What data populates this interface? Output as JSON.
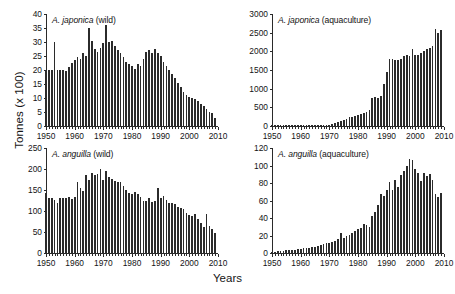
{
  "figure": {
    "ylabel": "Tonnes (x 100)",
    "xlabel": "Years",
    "bar_color": "#2b2b2b",
    "axis_color": "#2a2a2a"
  },
  "chart_data": [
    {
      "type": "bar",
      "panel": "top-left",
      "title": "A. japonica (wild)",
      "species": "A. japonica",
      "source": "wild",
      "xlabel": "Years",
      "ylabel": "Tonnes (x 100)",
      "ylim": [
        0,
        40
      ],
      "yticks": [
        0,
        5,
        10,
        15,
        20,
        25,
        30,
        35,
        40
      ],
      "xlim": [
        1950,
        2010
      ],
      "xticks": [
        1950,
        1960,
        1970,
        1980,
        1990,
        2000,
        2010
      ],
      "grid": false,
      "legend": "none",
      "x": [
        1950,
        1951,
        1952,
        1953,
        1954,
        1955,
        1956,
        1957,
        1958,
        1959,
        1960,
        1961,
        1962,
        1963,
        1964,
        1965,
        1966,
        1967,
        1968,
        1969,
        1970,
        1971,
        1972,
        1973,
        1974,
        1975,
        1976,
        1977,
        1978,
        1979,
        1980,
        1981,
        1982,
        1983,
        1984,
        1985,
        1986,
        1987,
        1988,
        1989,
        1990,
        1991,
        1992,
        1993,
        1994,
        1995,
        1996,
        1997,
        1998,
        1999,
        2000,
        2001,
        2002,
        2003,
        2004,
        2005,
        2006,
        2007,
        2008,
        2009
      ],
      "values": [
        20.0,
        20.0,
        20.0,
        30.0,
        20.0,
        20.0,
        20.0,
        19.5,
        21.0,
        22.5,
        23.5,
        24.5,
        24.0,
        26.0,
        25.0,
        35.0,
        30.5,
        27.5,
        26.5,
        28.0,
        29.5,
        36.0,
        30.0,
        30.5,
        28.5,
        27.0,
        26.0,
        24.5,
        23.0,
        22.0,
        21.5,
        20.5,
        22.0,
        21.5,
        24.0,
        26.5,
        27.0,
        26.0,
        27.5,
        26.0,
        25.0,
        23.0,
        21.5,
        20.0,
        18.5,
        17.0,
        15.5,
        14.0,
        12.0,
        11.0,
        10.5,
        10.0,
        9.5,
        9.0,
        8.0,
        7.0,
        6.0,
        5.0,
        4.5,
        3.0
      ]
    },
    {
      "type": "bar",
      "panel": "top-right",
      "title": "A. japonica (aquaculture)",
      "species": "A. japonica",
      "source": "aquaculture",
      "xlabel": "Years",
      "ylabel": "Tonnes (x 100)",
      "ylim": [
        0,
        3000
      ],
      "yticks": [
        0,
        500,
        1000,
        1500,
        2000,
        2500,
        3000
      ],
      "xlim": [
        1950,
        2010
      ],
      "xticks": [
        1950,
        1960,
        1970,
        1980,
        1990,
        2000,
        2010
      ],
      "grid": false,
      "legend": "none",
      "x": [
        1950,
        1951,
        1952,
        1953,
        1954,
        1955,
        1956,
        1957,
        1958,
        1959,
        1960,
        1961,
        1962,
        1963,
        1964,
        1965,
        1966,
        1967,
        1968,
        1969,
        1970,
        1971,
        1972,
        1973,
        1974,
        1975,
        1976,
        1977,
        1978,
        1979,
        1980,
        1981,
        1982,
        1983,
        1984,
        1985,
        1986,
        1987,
        1988,
        1989,
        1990,
        1991,
        1992,
        1993,
        1994,
        1995,
        1996,
        1997,
        1998,
        1999,
        2000,
        2001,
        2002,
        2003,
        2004,
        2005,
        2006,
        2007,
        2008,
        2009
      ],
      "values": [
        5,
        5,
        5,
        5,
        5,
        8,
        8,
        10,
        10,
        12,
        12,
        15,
        15,
        18,
        18,
        20,
        20,
        25,
        25,
        30,
        40,
        60,
        90,
        110,
        130,
        160,
        190,
        230,
        250,
        280,
        300,
        330,
        350,
        370,
        420,
        760,
        780,
        760,
        800,
        1130,
        1450,
        1800,
        1790,
        1780,
        1780,
        1790,
        1870,
        1900,
        1880,
        2060,
        1890,
        1900,
        1950,
        2000,
        2050,
        2080,
        2130,
        2600,
        2500,
        2580
      ]
    },
    {
      "type": "bar",
      "panel": "bottom-left",
      "title": "A. anguilla (wild)",
      "species": "A. anguilla",
      "source": "wild",
      "xlabel": "Years",
      "ylabel": "Tonnes (x 100)",
      "ylim": [
        0,
        250
      ],
      "yticks": [
        0,
        50,
        100,
        150,
        200,
        250
      ],
      "xlim": [
        1950,
        2010
      ],
      "xticks": [
        1950,
        1960,
        1970,
        1980,
        1990,
        2000,
        2010
      ],
      "grid": false,
      "legend": "none",
      "x": [
        1950,
        1951,
        1952,
        1953,
        1954,
        1955,
        1956,
        1957,
        1958,
        1959,
        1960,
        1961,
        1962,
        1963,
        1964,
        1965,
        1966,
        1967,
        1968,
        1969,
        1970,
        1971,
        1972,
        1973,
        1974,
        1975,
        1976,
        1977,
        1978,
        1979,
        1980,
        1981,
        1982,
        1983,
        1984,
        1985,
        1986,
        1987,
        1988,
        1989,
        1990,
        1991,
        1992,
        1993,
        1994,
        1995,
        1996,
        1997,
        1998,
        1999,
        2000,
        2001,
        2002,
        2003,
        2004,
        2005,
        2006,
        2007,
        2008,
        2009
      ],
      "values": [
        142,
        132,
        131,
        127,
        119,
        132,
        130,
        130,
        133,
        128,
        133,
        170,
        155,
        148,
        185,
        175,
        190,
        186,
        188,
        200,
        175,
        195,
        180,
        176,
        172,
        170,
        168,
        160,
        150,
        143,
        140,
        145,
        140,
        133,
        125,
        124,
        130,
        121,
        125,
        155,
        130,
        135,
        126,
        120,
        118,
        117,
        110,
        107,
        104,
        96,
        90,
        87,
        92,
        80,
        72,
        63,
        93,
        65,
        57,
        48
      ]
    },
    {
      "type": "bar",
      "panel": "bottom-right",
      "title": "A. anguilla (aquaculture)",
      "species": "A. anguilla",
      "source": "aquaculture",
      "xlabel": "Years",
      "ylabel": "Tonnes (x 100)",
      "ylim": [
        0,
        120
      ],
      "yticks": [
        0,
        20,
        40,
        60,
        80,
        100,
        120
      ],
      "xlim": [
        1950,
        2010
      ],
      "xticks": [
        1950,
        1960,
        1970,
        1980,
        1990,
        2000,
        2010
      ],
      "grid": false,
      "legend": "none",
      "x": [
        1950,
        1951,
        1952,
        1953,
        1954,
        1955,
        1956,
        1957,
        1958,
        1959,
        1960,
        1961,
        1962,
        1963,
        1964,
        1965,
        1966,
        1967,
        1968,
        1969,
        1970,
        1971,
        1972,
        1973,
        1974,
        1975,
        1976,
        1977,
        1978,
        1979,
        1980,
        1981,
        1982,
        1983,
        1984,
        1985,
        1986,
        1987,
        1988,
        1989,
        1990,
        1991,
        1992,
        1993,
        1994,
        1995,
        1996,
        1997,
        1998,
        1999,
        2000,
        2001,
        2002,
        2003,
        2004,
        2005,
        2006,
        2007,
        2008,
        2009
      ],
      "values": [
        1.5,
        1.5,
        2,
        2,
        2.5,
        3,
        3,
        3.5,
        4,
        4.5,
        5,
        5.5,
        6,
        6,
        7,
        7,
        8,
        9,
        10,
        11,
        12,
        13,
        14,
        16,
        23,
        17,
        19,
        21,
        23,
        25,
        27,
        29,
        33,
        32,
        30,
        42,
        47,
        55,
        67,
        65,
        72,
        81,
        72,
        83,
        76,
        89,
        94,
        100,
        107,
        106,
        96,
        91,
        82,
        91,
        88,
        90,
        83,
        67,
        64,
        69
      ]
    }
  ]
}
